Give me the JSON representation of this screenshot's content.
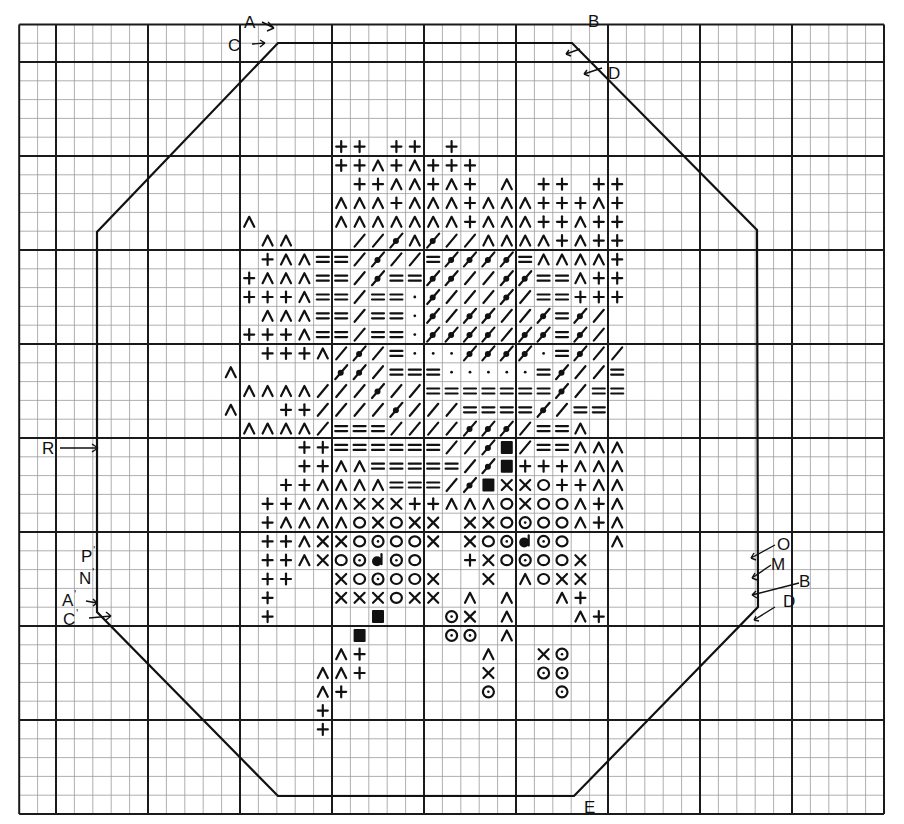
{
  "diagram": {
    "type": "knitting-chart",
    "grid": {
      "x0": 19.2,
      "y0": 24.4,
      "cell_w": 18.4,
      "cell_h": 18.8,
      "cols": 47,
      "rows": 42,
      "major_every": 5,
      "major_col_offset": 2,
      "major_row_offset": 2,
      "minor_color": "#9a9a9a",
      "major_color": "#1a1a1a"
    },
    "outline": {
      "points": [
        [
          278,
          43
        ],
        [
          572,
          43
        ],
        [
          757,
          230
        ],
        [
          758,
          607
        ],
        [
          574,
          796
        ],
        [
          278,
          796
        ],
        [
          97,
          612
        ],
        [
          97,
          232
        ]
      ],
      "color": "#111111"
    },
    "legend_codes": {
      "+": "plus",
      "^": "caret",
      "/": "slash",
      "b": "bead-slash",
      "=": "equals",
      ":": "dot",
      "X": "cross",
      "O": "circle",
      "o": "dotted-circle",
      "h": "half-filled-circle",
      "S": "solid-square",
      ".": "empty"
    },
    "symbol_rows": [
      {
        "row": 6,
        "cells": {
          "17": "+",
          "18": "+",
          "20": "+",
          "21": "+",
          "23": "+"
        }
      },
      {
        "row": 7,
        "cells": {
          "17": "+",
          "18": "+",
          "19": "^",
          "20": "+",
          "21": "^",
          "22": "+",
          "23": "+",
          "24": "+"
        }
      },
      {
        "row": 8,
        "cells": {
          "18": "+",
          "19": "+",
          "20": "^",
          "21": "^",
          "22": "+",
          "23": "^",
          "24": "+",
          "26": "^",
          "28": "+",
          "29": "+",
          "31": "+",
          "32": "+"
        }
      },
      {
        "row": 9,
        "cells": {
          "17": "^",
          "18": "^",
          "19": "^",
          "20": "+",
          "21": "^",
          "22": "^",
          "23": "^",
          "24": "+",
          "25": "^",
          "26": "^",
          "27": "^",
          "28": "+",
          "29": "+",
          "30": "+",
          "31": "^",
          "32": "+"
        }
      },
      {
        "row": 10,
        "cells": {
          "12": "^",
          "17": "^",
          "18": "^",
          "19": "^",
          "20": "^",
          "21": "^",
          "22": "^",
          "23": "^",
          "24": "+",
          "25": "^",
          "26": "^",
          "27": "^",
          "28": "+",
          "29": "+",
          "30": "^",
          "31": "+",
          "32": "+"
        }
      },
      {
        "row": 11,
        "cells": {
          "13": "^",
          "14": "^",
          "18": "/",
          "19": "/",
          "20": "b",
          "21": "^",
          "22": "b",
          "23": "/",
          "24": "/",
          "25": "^",
          "26": "^",
          "27": "^",
          "28": "^",
          "29": "+",
          "30": "^",
          "31": "+",
          "32": "+"
        }
      },
      {
        "row": 12,
        "cells": {
          "13": "+",
          "14": "^",
          "15": "^",
          "16": "=",
          "17": "=",
          "18": "/",
          "19": "b",
          "20": "/",
          "21": "/",
          "22": "=",
          "23": "b",
          "24": "b",
          "25": "b",
          "26": "b",
          "27": "=",
          "28": "^",
          "29": "^",
          "30": "^",
          "31": "^",
          "32": "+"
        }
      },
      {
        "row": 13,
        "cells": {
          "12": "+",
          "13": "^",
          "14": "^",
          "15": "^",
          "16": "=",
          "17": "=",
          "18": "/",
          "19": "b",
          "20": "=",
          "21": "=",
          "22": "b",
          "23": "b",
          "24": "/",
          "25": "/",
          "26": "b",
          "27": "b",
          "28": "=",
          "29": "=",
          "30": "^",
          "31": "+",
          "32": "+"
        }
      },
      {
        "row": 14,
        "cells": {
          "12": "+",
          "13": "+",
          "14": "+",
          "15": "^",
          "16": "=",
          "17": "=",
          "18": "/",
          "19": "=",
          "20": "=",
          "21": ":",
          "22": "b",
          "23": "/",
          "24": "/",
          "25": "/",
          "26": "b",
          "27": "/",
          "28": "=",
          "29": "=",
          "30": "+",
          "31": "+",
          "32": "+"
        }
      },
      {
        "row": 15,
        "cells": {
          "13": "^",
          "14": "^",
          "15": "^",
          "16": "=",
          "17": "=",
          "18": "/",
          "19": "=",
          "20": "=",
          "21": ":",
          "22": "b",
          "23": "/",
          "24": "b",
          "25": "b",
          "26": "/",
          "27": "/",
          "28": "b",
          "29": "=",
          "30": "b",
          "31": "/"
        }
      },
      {
        "row": 16,
        "cells": {
          "12": "+",
          "13": "+",
          "14": "+",
          "15": "^",
          "16": "=",
          "17": "=",
          "18": "/",
          "19": "=",
          "20": "=",
          "21": ":",
          "22": "b",
          "23": "b",
          "24": "b",
          "25": "b",
          "26": "/",
          "27": "b",
          "28": "b",
          "29": "=",
          "30": "b",
          "31": "/"
        }
      },
      {
        "row": 17,
        "cells": {
          "13": "+",
          "14": "+",
          "15": "+",
          "16": "^",
          "17": "/",
          "18": "b",
          "19": "/",
          "20": "=",
          "21": ":",
          "22": ":",
          "23": ":",
          "24": "b",
          "25": "b",
          "26": "b",
          "27": "b",
          "28": ":",
          "29": "=",
          "30": "b",
          "31": "/",
          "32": "/"
        }
      },
      {
        "row": 18,
        "cells": {
          "11": "^",
          "17": "b",
          "18": "b",
          "19": "/",
          "20": "=",
          "21": "=",
          "22": "=",
          "23": ":",
          "24": ":",
          "25": ":",
          "26": ":",
          "27": ":",
          "28": "=",
          "29": "b",
          "30": "/",
          "31": "/",
          "32": "="
        }
      },
      {
        "row": 19,
        "cells": {
          "12": "^",
          "13": "^",
          "14": "^",
          "15": "^",
          "16": "/",
          "17": "/",
          "18": "/",
          "19": "b",
          "20": "/",
          "21": "/",
          "22": "=",
          "23": "=",
          "24": "=",
          "25": "=",
          "26": "=",
          "27": "=",
          "28": "=",
          "29": "b",
          "30": "/",
          "31": "=",
          "32": "="
        }
      },
      {
        "row": 20,
        "cells": {
          "11": "^",
          "14": "+",
          "15": "+",
          "16": "/",
          "17": "/",
          "18": "/",
          "19": "/",
          "20": "b",
          "21": "/",
          "22": "/",
          "23": "/",
          "24": "=",
          "25": "=",
          "26": "=",
          "27": "=",
          "28": "b",
          "29": "/",
          "30": "=",
          "31": "="
        }
      },
      {
        "row": 21,
        "cells": {
          "12": "^",
          "13": "^",
          "14": "^",
          "15": "^",
          "16": "/",
          "17": "=",
          "18": "=",
          "19": "=",
          "20": "/",
          "21": "/",
          "22": "/",
          "23": "/",
          "24": "b",
          "25": "b",
          "26": "b",
          "27": "/",
          "28": "=",
          "29": "=",
          "30": "^"
        }
      },
      {
        "row": 22,
        "cells": {
          "15": "+",
          "16": "+",
          "17": "=",
          "18": "=",
          "19": "=",
          "20": "=",
          "21": "=",
          "22": "=",
          "23": "/",
          "24": "/",
          "25": "b",
          "26": "S",
          "27": "/",
          "28": "=",
          "29": "=",
          "30": "^",
          "31": "^",
          "32": "^"
        }
      },
      {
        "row": 23,
        "cells": {
          "15": "+",
          "16": "+",
          "17": "^",
          "18": "^",
          "19": "=",
          "20": "=",
          "21": "=",
          "22": "=",
          "23": "=",
          "24": "/",
          "25": "b",
          "26": "S",
          "27": "+",
          "28": "+",
          "29": "+",
          "30": "^",
          "31": "^",
          "32": "^"
        }
      },
      {
        "row": 24,
        "cells": {
          "14": "+",
          "15": "+",
          "16": "^",
          "17": "^",
          "18": "^",
          "19": "^",
          "20": "=",
          "21": "=",
          "22": "=",
          "23": "/",
          "24": "b",
          "25": "S",
          "26": "X",
          "27": "X",
          "28": "O",
          "29": "+",
          "30": "+",
          "31": "^",
          "32": "^"
        }
      },
      {
        "row": 25,
        "cells": {
          "13": "+",
          "14": "+",
          "15": "^",
          "16": "^",
          "17": "^",
          "18": "X",
          "19": "X",
          "20": "X",
          "21": "+",
          "22": "+",
          "23": "^",
          "24": "^",
          "25": "^",
          "26": "O",
          "27": "X",
          "28": "O",
          "29": "O",
          "30": "^",
          "31": "+",
          "32": "^"
        }
      },
      {
        "row": 26,
        "cells": {
          "13": "+",
          "14": "^",
          "15": "^",
          "16": "^",
          "17": "^",
          "18": "O",
          "19": "X",
          "20": "O",
          "21": "X",
          "22": "X",
          "24": "X",
          "25": "X",
          "26": "O",
          "27": "o",
          "28": "O",
          "29": "O",
          "30": "^",
          "31": "+",
          "32": "^"
        }
      },
      {
        "row": 27,
        "cells": {
          "13": "+",
          "14": "+",
          "15": "^",
          "16": "X",
          "17": "X",
          "18": "O",
          "19": "o",
          "20": "O",
          "21": "O",
          "22": "X",
          "24": "X",
          "25": "O",
          "26": "o",
          "27": "h",
          "28": "o",
          "29": "O",
          "32": "^"
        }
      },
      {
        "row": 28,
        "cells": {
          "13": "+",
          "14": "+",
          "15": "^",
          "16": "X",
          "17": "O",
          "18": "o",
          "19": "h",
          "20": "o",
          "21": "O",
          "24": "+",
          "25": "X",
          "26": "O",
          "27": "o",
          "28": "O",
          "29": "O",
          "30": "X"
        }
      },
      {
        "row": 29,
        "cells": {
          "13": "+",
          "14": "+",
          "17": "X",
          "18": "O",
          "19": "o",
          "20": "O",
          "21": "O",
          "22": "X",
          "25": "X",
          "27": "^",
          "28": "O",
          "29": "X",
          "30": "X"
        }
      },
      {
        "row": 30,
        "cells": {
          "13": "+",
          "17": "X",
          "18": "X",
          "19": "X",
          "20": "O",
          "21": "X",
          "22": "X",
          "24": "^",
          "26": "^",
          "29": "^",
          "30": "+"
        }
      },
      {
        "row": 31,
        "cells": {
          "13": "+",
          "19": "S",
          "23": "o",
          "24": "X",
          "26": "^",
          "30": "^",
          "31": "+"
        }
      },
      {
        "row": 32,
        "cells": {
          "18": "S",
          "23": "o",
          "24": "o",
          "26": "^"
        }
      },
      {
        "row": 33,
        "cells": {
          "17": "^",
          "18": "+",
          "25": "^",
          "28": "X",
          "29": "o"
        }
      },
      {
        "row": 34,
        "cells": {
          "16": "^",
          "17": "^",
          "18": "+",
          "25": "X",
          "28": "o",
          "29": "o"
        }
      },
      {
        "row": 35,
        "cells": {
          "16": "^",
          "17": "+",
          "25": "o",
          "29": "o"
        }
      },
      {
        "row": 36,
        "cells": {
          "16": "+"
        }
      },
      {
        "row": 37,
        "cells": {
          "16": "+"
        }
      }
    ]
  },
  "labels": {
    "A": {
      "text": "A",
      "prime": ""
    },
    "C": {
      "text": "C",
      "prime": ""
    },
    "B": {
      "text": "B",
      "prime": ""
    },
    "D": {
      "text": "D",
      "prime": ""
    },
    "R_prime": {
      "text": "R",
      "prime": "'"
    },
    "P_prime": {
      "text": "P",
      "prime": "'"
    },
    "N_prime": {
      "text": "N",
      "prime": "'"
    },
    "A_prime": {
      "text": "A",
      "prime": "'"
    },
    "C_prime": {
      "text": "C",
      "prime": "'"
    },
    "O_right": {
      "text": "O",
      "prime": ""
    },
    "M_right": {
      "text": "M",
      "prime": ""
    },
    "B_right": {
      "text": "B",
      "prime": ""
    },
    "D_right": {
      "text": "D",
      "prime": ""
    },
    "E": {
      "text": "E",
      "prime": ""
    }
  }
}
